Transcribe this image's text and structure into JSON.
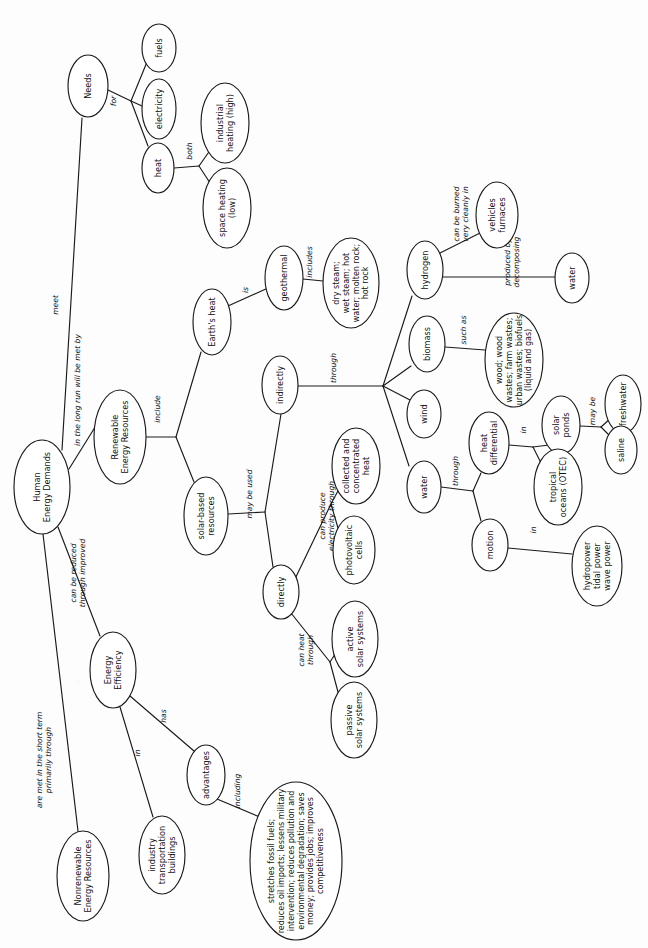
{
  "diagram": {
    "type": "concept-map",
    "orientation": "rotated-90-clockwise",
    "background_color": "#fdfdfd",
    "line_color": "#1a1a1a",
    "node_fill": "#ffffff",
    "nodes": [
      {
        "id": "human_energy_demands",
        "label": "Human\nEnergy Demands",
        "cx": 42,
        "cy": 487,
        "rx": 28,
        "ry": 47,
        "fs": 8.2
      },
      {
        "id": "needs",
        "label": "Needs",
        "cx": 88,
        "cy": 86,
        "rx": 20,
        "ry": 31,
        "fs": 8.2
      },
      {
        "id": "fuels",
        "label": "fuels",
        "cx": 159,
        "cy": 48,
        "rx": 17,
        "ry": 24,
        "fs": 8.2
      },
      {
        "id": "electricity",
        "label": "electricity",
        "cx": 159,
        "cy": 109,
        "rx": 17,
        "ry": 30,
        "fs": 8.2
      },
      {
        "id": "heat",
        "label": "heat",
        "cx": 158,
        "cy": 168,
        "rx": 16,
        "ry": 25,
        "fs": 8.2
      },
      {
        "id": "industrial_heating",
        "label": "industrial\nheating (high)",
        "cx": 225,
        "cy": 123,
        "rx": 24,
        "ry": 40,
        "fs": 8.2
      },
      {
        "id": "space_heating",
        "label": "space heating\n(low)",
        "cx": 227,
        "cy": 208,
        "rx": 24,
        "ry": 40,
        "fs": 8.2
      },
      {
        "id": "renewable_energy_resources",
        "label": "Renewable\nEnergy Resources",
        "cx": 120,
        "cy": 437,
        "rx": 26,
        "ry": 47,
        "fs": 8.2
      },
      {
        "id": "earths_heat",
        "label": "Earth's heat",
        "cx": 212,
        "cy": 322,
        "rx": 19,
        "ry": 33,
        "fs": 8.2
      },
      {
        "id": "geothermal",
        "label": "geothermal",
        "cx": 284,
        "cy": 278,
        "rx": 19,
        "ry": 32,
        "fs": 8.2
      },
      {
        "id": "geothermal_types",
        "label": "dry steam;\nwet steam; hot\nwater; molten rock;\nhot rock",
        "cx": 351,
        "cy": 283,
        "rx": 28,
        "ry": 45,
        "fs": 8.0
      },
      {
        "id": "solar_based_resources",
        "label": "solar-based\nresources",
        "cx": 206,
        "cy": 516,
        "rx": 22,
        "ry": 39,
        "fs": 8.2
      },
      {
        "id": "indirectly",
        "label": "indirectly",
        "cx": 280,
        "cy": 385,
        "rx": 18,
        "ry": 29,
        "fs": 8.2
      },
      {
        "id": "directly",
        "label": "directly",
        "cx": 281,
        "cy": 592,
        "rx": 18,
        "ry": 27,
        "fs": 8.2
      },
      {
        "id": "hydrogen",
        "label": "hydrogen",
        "cx": 425,
        "cy": 270,
        "rx": 18,
        "ry": 29,
        "fs": 8.2
      },
      {
        "id": "biomass",
        "label": "biomass",
        "cx": 427,
        "cy": 344,
        "rx": 18,
        "ry": 28,
        "fs": 8.2
      },
      {
        "id": "wind",
        "label": "wind",
        "cx": 424,
        "cy": 414,
        "rx": 17,
        "ry": 24,
        "fs": 8.2
      },
      {
        "id": "water",
        "label": "water",
        "cx": 424,
        "cy": 487,
        "rx": 17,
        "ry": 26,
        "fs": 8.2
      },
      {
        "id": "vehicles_furnaces",
        "label": "vehicles\nfurnaces",
        "cx": 497,
        "cy": 215,
        "rx": 21,
        "ry": 33,
        "fs": 8.2
      },
      {
        "id": "water_h2",
        "label": "water",
        "cx": 572,
        "cy": 278,
        "rx": 17,
        "ry": 25,
        "fs": 8.2
      },
      {
        "id": "biomass_types",
        "label": "wood; wood\nwastes; farm wastes;\nurban wastes; biofuels\n(liquid and gas)",
        "cx": 514,
        "cy": 360,
        "rx": 29,
        "ry": 47,
        "fs": 8.0
      },
      {
        "id": "heat_differential",
        "label": "heat\ndifferential",
        "cx": 489,
        "cy": 443,
        "rx": 20,
        "ry": 31,
        "fs": 8.2
      },
      {
        "id": "motion",
        "label": "motion",
        "cx": 490,
        "cy": 545,
        "rx": 18,
        "ry": 26,
        "fs": 8.2
      },
      {
        "id": "solar_ponds",
        "label": "solar\nponds",
        "cx": 561,
        "cy": 425,
        "rx": 19,
        "ry": 29,
        "fs": 8.2
      },
      {
        "id": "tropical_oceans",
        "label": "tropical\noceans (OTEC)",
        "cx": 558,
        "cy": 487,
        "rx": 24,
        "ry": 38,
        "fs": 8.2
      },
      {
        "id": "freshwater",
        "label": "freshwater",
        "cx": 623,
        "cy": 404,
        "rx": 18,
        "ry": 29,
        "fs": 8.2
      },
      {
        "id": "saline",
        "label": "saline",
        "cx": 621,
        "cy": 450,
        "rx": 16,
        "ry": 24,
        "fs": 8.2
      },
      {
        "id": "hydro_tidal_wave",
        "label": "hydropower\ntidal power\nwave power",
        "cx": 597,
        "cy": 566,
        "rx": 25,
        "ry": 40,
        "fs": 8.2
      },
      {
        "id": "collected_concentrated_heat",
        "label": "collected and\nconcentrated\nheat",
        "cx": 356,
        "cy": 466,
        "rx": 24,
        "ry": 38,
        "fs": 8.2
      },
      {
        "id": "photovoltaic_cells",
        "label": "photovoltaic\ncells",
        "cx": 354,
        "cy": 550,
        "rx": 21,
        "ry": 34,
        "fs": 8.2
      },
      {
        "id": "active_solar_systems",
        "label": "active\nsolar systems",
        "cx": 355,
        "cy": 639,
        "rx": 23,
        "ry": 38,
        "fs": 8.2
      },
      {
        "id": "passive_solar_systems",
        "label": "passive\nsolar systems",
        "cx": 354,
        "cy": 720,
        "rx": 23,
        "ry": 38,
        "fs": 8.2
      },
      {
        "id": "energy_efficiency",
        "label": "Energy\nEfficiency",
        "cx": 113,
        "cy": 670,
        "rx": 23,
        "ry": 38,
        "fs": 8.2
      },
      {
        "id": "nonrenewable_energy_resources",
        "label": "Nonrenewable\nEnergy Resources",
        "cx": 83,
        "cy": 876,
        "rx": 26,
        "ry": 45,
        "fs": 8.2
      },
      {
        "id": "industry_transportation_buildings",
        "label": "industry\ntransportation\nbuildings",
        "cx": 162,
        "cy": 855,
        "rx": 23,
        "ry": 39,
        "fs": 8.2
      },
      {
        "id": "advantages",
        "label": "advantages",
        "cx": 206,
        "cy": 775,
        "rx": 19,
        "ry": 30,
        "fs": 8.2
      },
      {
        "id": "advantages_list",
        "label": "stretches fossil fuels;\nreduces oil imports; lessens military\nintervention; reduces pollution and\nenvironmental degradation; saves\nmoney; provides jobs; improves\ncompetitiveness",
        "cx": 296,
        "cy": 861,
        "rx": 46,
        "ry": 79,
        "fs": 8.0
      }
    ],
    "edges": [
      {
        "from": "human_energy_demands",
        "to": "needs",
        "label": "meet",
        "lx": 55,
        "ly": 305,
        "path": "M 62,450 L 82,118"
      },
      {
        "from": "needs",
        "to": "junction_needs",
        "label": "for",
        "lx": 113,
        "ly": 101,
        "path": "M 108,90 L 131,101"
      },
      {
        "from": "junction_needs",
        "to": "fuels",
        "label": "",
        "path": "M 131,101 L 147,62"
      },
      {
        "from": "junction_needs",
        "to": "electricity",
        "label": "",
        "path": "M 131,101 L 142,106"
      },
      {
        "from": "junction_needs",
        "to": "heat",
        "label": "",
        "path": "M 131,101 L 148,146"
      },
      {
        "from": "heat",
        "to": "junction_heat",
        "label": "both",
        "lx": 189,
        "ly": 151,
        "path": "M 174,168 L 199,166"
      },
      {
        "from": "junction_heat",
        "to": "industrial_heating",
        "label": "",
        "path": "M 199,166 L 211,149"
      },
      {
        "from": "junction_heat",
        "to": "space_heating",
        "label": "",
        "path": "M 199,166 L 212,186"
      },
      {
        "from": "human_energy_demands",
        "to": "renewable_energy_resources",
        "label": "in the long run will be met by",
        "lx": 77,
        "ly": 390,
        "path": "M 69,469 L 97,424"
      },
      {
        "from": "renewable_energy_resources",
        "to": "junction_rer",
        "label": "include",
        "lx": 157,
        "ly": 409,
        "path": "M 146,437 L 176,437"
      },
      {
        "from": "junction_rer",
        "to": "earths_heat",
        "label": "",
        "path": "M 176,437 L 201,352"
      },
      {
        "from": "junction_rer",
        "to": "solar_based_resources",
        "label": "",
        "path": "M 176,437 L 194,482"
      },
      {
        "from": "earths_heat",
        "to": "geothermal",
        "label": "is",
        "lx": 245,
        "ly": 290,
        "path": "M 228,306 L 268,288"
      },
      {
        "from": "geothermal",
        "to": "geothermal_types",
        "label": "includes",
        "lx": 309,
        "ly": 262,
        "path": "M 303,279 L 323,281"
      },
      {
        "from": "solar_based_resources",
        "to": "junction_sbr",
        "label": "may be used",
        "lx": 249,
        "ly": 494,
        "path": "M 228,514 L 265,512"
      },
      {
        "from": "junction_sbr",
        "to": "indirectly",
        "label": "",
        "path": "M 265,512 L 281,414"
      },
      {
        "from": "junction_sbr",
        "to": "directly",
        "label": "",
        "path": "M 265,512 L 273,567"
      },
      {
        "from": "indirectly",
        "to": "junction_indirect",
        "label": "through",
        "lx": 333,
        "ly": 368,
        "path": "M 298,386 L 383,386"
      },
      {
        "from": "junction_indirect",
        "to": "hydrogen",
        "label": "",
        "path": "M 383,386 L 412,296"
      },
      {
        "from": "junction_indirect",
        "to": "biomass",
        "label": "",
        "path": "M 383,386 L 411,366"
      },
      {
        "from": "junction_indirect",
        "to": "wind",
        "label": "",
        "path": "M 383,386 L 410,400"
      },
      {
        "from": "junction_indirect",
        "to": "water",
        "label": "",
        "path": "M 383,386 L 409,466"
      },
      {
        "from": "hydrogen",
        "to": "vehicles_furnaces",
        "label": "can be burned\nvery cleanly in",
        "lx": 461,
        "ly": 214,
        "path": "M 438,254 L 480,233"
      },
      {
        "from": "hydrogen",
        "to": "water_h2",
        "label": "produced by\ndecomposing",
        "lx": 512,
        "ly": 262,
        "path": "M 443,277 L 555,277"
      },
      {
        "from": "biomass",
        "to": "biomass_types",
        "label": "such as",
        "lx": 463,
        "ly": 330,
        "path": "M 445,347 L 485,350"
      },
      {
        "from": "water",
        "to": "junction_water",
        "label": "through",
        "lx": 455,
        "ly": 471,
        "path": "M 441,487 L 473,491"
      },
      {
        "from": "junction_water",
        "to": "heat_differential",
        "label": "",
        "path": "M 473,491 L 481,473"
      },
      {
        "from": "junction_water",
        "to": "motion",
        "label": "",
        "path": "M 473,491 L 481,521"
      },
      {
        "from": "heat_differential",
        "to": "junction_hd",
        "label": "in",
        "lx": 523,
        "ly": 430,
        "path": "M 509,445 L 533,447"
      },
      {
        "from": "junction_hd",
        "to": "solar_ponds",
        "label": "",
        "path": "M 533,447 L 549,445"
      },
      {
        "from": "junction_hd",
        "to": "tropical_oceans",
        "label": "",
        "path": "M 533,447 L 541,463"
      },
      {
        "from": "solar_ponds",
        "to": "junction_sp",
        "label": "may be",
        "lx": 592,
        "ly": 411,
        "path": "M 580,426 L 601,427"
      },
      {
        "from": "junction_sp",
        "to": "freshwater",
        "label": "",
        "path": "M 601,427 L 611,418"
      },
      {
        "from": "junction_sp",
        "to": "saline",
        "label": "",
        "path": "M 601,427 L 611,437"
      },
      {
        "from": "motion",
        "to": "hydro_tidal_wave",
        "label": "in",
        "lx": 533,
        "ly": 530,
        "path": "M 508,548 L 572,554"
      },
      {
        "from": "directly",
        "to": "junction_pv",
        "label": "can produce\nelectricity through",
        "lx": 327,
        "ly": 516,
        "path": "M 294,581 L 331,504"
      },
      {
        "from": "junction_pv",
        "to": "collected_concentrated_heat",
        "label": "",
        "path": "M 331,504 L 339,489"
      },
      {
        "from": "junction_pv",
        "to": "photovoltaic_cells",
        "label": "",
        "path": "M 331,504 L 338,528"
      },
      {
        "from": "directly",
        "to": "junction_solar_heat",
        "label": "can heat\nthrough",
        "lx": 306,
        "ly": 650,
        "path": "M 291,613 L 330,662"
      },
      {
        "from": "junction_solar_heat",
        "to": "active_solar_systems",
        "label": "",
        "path": "M 330,662 L 339,648"
      },
      {
        "from": "junction_solar_heat",
        "to": "passive_solar_systems",
        "label": "",
        "path": "M 330,662 L 338,692"
      },
      {
        "from": "human_energy_demands",
        "to": "energy_efficiency",
        "label": "can be reduced\nthrough improved",
        "lx": 78,
        "ly": 573,
        "path": "M 58,527 L 100,636"
      },
      {
        "from": "human_energy_demands",
        "to": "nonrenewable_energy_resources",
        "label": "are met in the short term\nprimarily through",
        "lx": 44,
        "ly": 760,
        "path": "M 43,534 L 78,831"
      },
      {
        "from": "energy_efficiency",
        "to": "industry_transportation_buildings",
        "label": "in",
        "lx": 137,
        "ly": 753,
        "path": "M 120,707 L 153,817"
      },
      {
        "from": "energy_efficiency",
        "to": "advantages",
        "label": "has",
        "lx": 163,
        "ly": 716,
        "path": "M 130,696 L 194,751"
      },
      {
        "from": "advantages",
        "to": "advantages_list",
        "label": "including",
        "lx": 237,
        "ly": 791,
        "path": "M 217,799 L 262,818"
      }
    ]
  }
}
